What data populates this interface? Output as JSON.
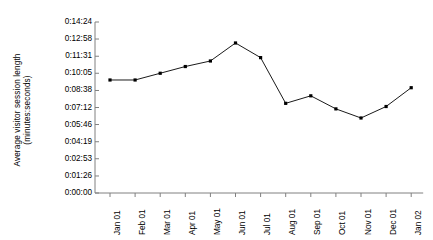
{
  "chart_data": {
    "type": "line",
    "title": "",
    "xlabel": "",
    "ylabel": "Average visitor session length (minutes:seconds)",
    "ylabel_line1": "Average visitor session length",
    "ylabel_line2": "(minutes:seconds)",
    "categories": [
      "Jan 01",
      "Feb 01",
      "Mar 01",
      "Apr 01",
      "May 01",
      "Jun 01",
      "Jul 01",
      "Aug 01",
      "Sep 01",
      "Oct 01",
      "Nov 01",
      "Dec 01",
      "Jan 02"
    ],
    "values": [
      "0:09:31",
      "0:09:31",
      "0:10:05",
      "0:10:39",
      "0:11:07",
      "0:12:38",
      "0:11:24",
      "0:07:33",
      "0:08:11",
      "0:07:05",
      "0:06:19",
      "0:07:17",
      "0:08:52"
    ],
    "values_seconds": [
      571,
      571,
      605,
      639,
      667,
      758,
      684,
      453,
      491,
      425,
      379,
      437,
      532
    ],
    "ytick_labels": [
      "0:00:00",
      "0:01:26",
      "0:02:53",
      "0:04:19",
      "0:05:46",
      "0:07:12",
      "0:08:38",
      "0:10:05",
      "0:11:31",
      "0:12:58",
      "0:14:24"
    ],
    "ytick_seconds": [
      0,
      86,
      173,
      259,
      346,
      432,
      518,
      605,
      691,
      778,
      864
    ],
    "ylim": [
      0,
      864
    ],
    "grid": false,
    "legend": "none",
    "marker": "square",
    "line_color": "#000000",
    "marker_color": "#000000",
    "axis_color": "#808080",
    "background_color": "#ffffff"
  }
}
